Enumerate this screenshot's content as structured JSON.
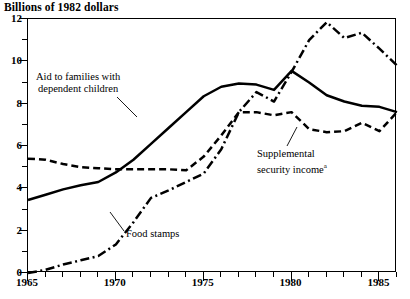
{
  "chart_data": {
    "type": "line",
    "title": "Billions of 1982 dollars",
    "xlabel": "",
    "ylabel": "Billions of 1982 dollars",
    "xlim": [
      1965,
      1986
    ],
    "ylim": [
      0,
      12
    ],
    "grid": false,
    "legend": "inline-annotations",
    "x_ticks_major": [
      1965,
      1970,
      1975,
      1980,
      1985
    ],
    "x_tick_labels": [
      "1965",
      "1970",
      "1975",
      "1980",
      "1985"
    ],
    "y_ticks_major": [
      0,
      2,
      4,
      6,
      8,
      10,
      12
    ],
    "y_tick_labels": [
      "0",
      "2",
      "4",
      "6",
      "8",
      "10",
      "12"
    ],
    "y_ticks_minor": [
      1,
      3,
      5,
      7,
      9,
      11
    ],
    "x": [
      1965,
      1966,
      1967,
      1968,
      1969,
      1970,
      1971,
      1972,
      1973,
      1974,
      1975,
      1976,
      1977,
      1978,
      1979,
      1980,
      1981,
      1982,
      1983,
      1984,
      1985,
      1986
    ],
    "series": [
      {
        "name": "Aid to families with dependent children",
        "style": "solid",
        "values": [
          3.45,
          3.7,
          3.95,
          4.15,
          4.3,
          4.75,
          5.35,
          6.1,
          6.85,
          7.6,
          8.35,
          8.8,
          8.95,
          8.9,
          8.65,
          9.55,
          9.0,
          8.4,
          8.1,
          7.9,
          7.85,
          7.6
        ]
      },
      {
        "name": "Food stamps",
        "style": "dash-dot",
        "values": [
          0.0,
          0.15,
          0.4,
          0.6,
          0.8,
          1.35,
          2.4,
          3.55,
          3.9,
          4.3,
          4.7,
          5.85,
          7.6,
          8.55,
          8.1,
          9.5,
          11.0,
          11.85,
          11.1,
          11.35,
          10.6,
          9.8
        ]
      },
      {
        "name": "Supplemental security income",
        "style": "dashed",
        "values": [
          5.4,
          5.35,
          5.15,
          5.0,
          4.95,
          4.9,
          4.9,
          4.9,
          4.9,
          4.85,
          5.5,
          6.5,
          7.6,
          7.6,
          7.45,
          7.6,
          6.8,
          6.65,
          6.7,
          7.1,
          6.7,
          7.6
        ]
      }
    ],
    "annotations": [
      {
        "id": "afdc",
        "line1": "Aid to families with",
        "line2": "dependent children",
        "superscript": ""
      },
      {
        "id": "food",
        "line1": "Food stamps",
        "line2": "",
        "superscript": ""
      },
      {
        "id": "ssi",
        "line1": "Supplemental",
        "line2": "security income",
        "superscript": "a"
      }
    ],
    "colors": {
      "line": "#000000",
      "background": "#ffffff",
      "axis": "#000000"
    }
  }
}
